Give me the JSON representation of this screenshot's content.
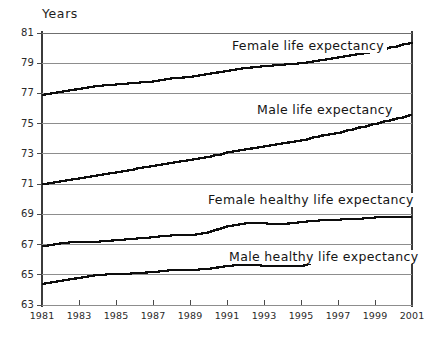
{
  "chart_data": {
    "type": "line",
    "title": "",
    "subtitle": "",
    "xlabel": "",
    "ylabel": "Years",
    "ylim": [
      63,
      81
    ],
    "xlim": [
      1981,
      2001
    ],
    "ytick_step": 2,
    "xtick_step": 2,
    "grid": true,
    "legend_position": "inline-annotations",
    "yticks": [
      "81",
      "79",
      "77",
      "75",
      "73",
      "71",
      "69",
      "67",
      "65",
      "63"
    ],
    "ytick_values": [
      81,
      79,
      77,
      75,
      73,
      71,
      69,
      67,
      65,
      63
    ],
    "xticks": [
      "1981",
      "1983",
      "1985",
      "1987",
      "1989",
      "1991",
      "1993",
      "1995",
      "1997",
      "1999",
      "2001"
    ],
    "xtick_values": [
      1981,
      1983,
      1985,
      1987,
      1989,
      1991,
      1993,
      1995,
      1997,
      1999,
      2001
    ],
    "x": [
      1981,
      1982,
      1983,
      1984,
      1985,
      1986,
      1987,
      1988,
      1989,
      1990,
      1991,
      1992,
      1993,
      1994,
      1995,
      1996,
      1997,
      1998,
      1999,
      2000,
      2001
    ],
    "series": [
      {
        "name": "Female life expectancy",
        "color": "#0d0d0d",
        "values": [
          76.9,
          77.1,
          77.3,
          77.5,
          77.6,
          77.7,
          77.8,
          78.0,
          78.1,
          78.3,
          78.5,
          78.7,
          78.8,
          78.9,
          79.0,
          79.2,
          79.4,
          79.6,
          79.8,
          80.1,
          80.4
        ]
      },
      {
        "name": "Male life expectancy",
        "color": "#0d0d0d",
        "values": [
          71.0,
          71.2,
          71.4,
          71.6,
          71.8,
          72.0,
          72.2,
          72.4,
          72.6,
          72.8,
          73.1,
          73.3,
          73.5,
          73.7,
          73.9,
          74.2,
          74.4,
          74.7,
          75.0,
          75.3,
          75.6
        ]
      },
      {
        "name": "Female healthy life expectancy",
        "color": "#0d0d0d",
        "values": [
          66.9,
          67.1,
          67.2,
          67.2,
          67.3,
          67.4,
          67.5,
          67.6,
          67.6,
          67.8,
          68.2,
          68.4,
          68.4,
          68.35,
          68.5,
          68.6,
          68.65,
          68.7,
          68.8,
          68.8,
          68.8
        ]
      },
      {
        "name": "Male healthy life expectancy",
        "color": "#0d0d0d",
        "values": [
          64.4,
          64.6,
          64.8,
          65.0,
          65.05,
          65.1,
          65.2,
          65.3,
          65.3,
          65.4,
          65.6,
          65.65,
          65.6,
          65.55,
          65.6,
          65.9,
          66.1,
          66.2,
          66.1,
          66.2,
          66.5
        ]
      }
    ],
    "annotations": [
      {
        "text": "Female life expectancy",
        "x_px": 229,
        "y_px": 39
      },
      {
        "text": "Male life expectancy",
        "x_px": 254,
        "y_px": 103
      },
      {
        "text": "Female healthy life expectancy",
        "x_px": 205,
        "y_px": 193
      },
      {
        "text": "Male healthy life expectancy",
        "x_px": 226,
        "y_px": 250
      }
    ],
    "colors": {
      "line": "#0d0d0d",
      "gridline": "#8d8d8d",
      "axis": "#3b3b3b",
      "background": "#ffffff",
      "text": "#1a1a1a"
    }
  }
}
